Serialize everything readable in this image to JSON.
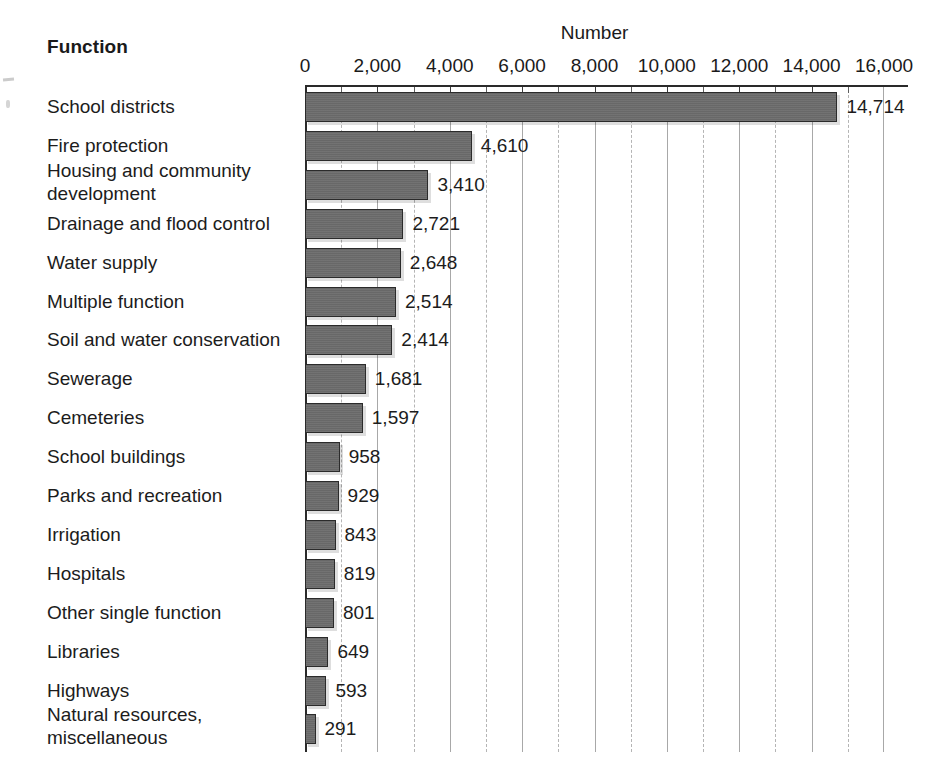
{
  "header": {
    "function_label": "Function",
    "number_label": "Number"
  },
  "chart_data": {
    "type": "bar",
    "orientation": "horizontal",
    "title": "Number",
    "xlabel": "Number",
    "ylabel": "Function",
    "xlim": [
      0,
      16000
    ],
    "xticks": [
      0,
      2000,
      4000,
      6000,
      8000,
      10000,
      12000,
      14000,
      16000
    ],
    "xtick_labels": [
      "0",
      "2,000",
      "4,000",
      "6,000",
      "8,000",
      "10,000",
      "12,000",
      "14,000",
      "16,000"
    ],
    "minor_tick_step": 1000,
    "grid": true,
    "legend": false,
    "bar_color": "#6b6b6b",
    "bar_edge_color": "#2b2b2b",
    "categories": [
      "School districts",
      "Fire protection",
      "Housing and community\n    development",
      "Drainage and flood control",
      "Water supply",
      "Multiple function",
      "Soil and water conservation",
      "Sewerage",
      "Cemeteries",
      "School buildings",
      "Parks and recreation",
      "Irrigation",
      "Hospitals",
      "Other single function",
      "Libraries",
      "Highways",
      "Natural resources,\n    miscellaneous"
    ],
    "values": [
      14714,
      4610,
      3410,
      2721,
      2648,
      2514,
      2414,
      1681,
      1597,
      958,
      929,
      843,
      819,
      801,
      649,
      593,
      291
    ],
    "value_labels": [
      "14,714",
      "4,610",
      "3,410",
      "2,721",
      "2,648",
      "2,514",
      "2,414",
      "1,681",
      "1,597",
      "958",
      "929",
      "843",
      "819",
      "801",
      "649",
      "593",
      "291"
    ]
  }
}
